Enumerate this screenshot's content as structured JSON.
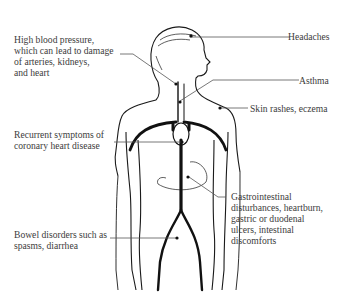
{
  "diagram": {
    "type": "anatomical-annotation",
    "labels": [
      {
        "id": "hbp",
        "text": "High blood pressure,\nwhich can lead to damage\nof arteries, kidneys,\nand heart",
        "side": "left"
      },
      {
        "id": "coronary",
        "text": "Recurrent symptoms of\ncoronary heart disease",
        "side": "left"
      },
      {
        "id": "bowel",
        "text": "Bowel disorders such as\nspasms, diarrhea",
        "side": "left"
      },
      {
        "id": "headaches",
        "text": "Headaches",
        "side": "right"
      },
      {
        "id": "asthma",
        "text": "Asthma",
        "side": "right"
      },
      {
        "id": "skin",
        "text": "Skin rashes, eczema",
        "side": "right"
      },
      {
        "id": "gi",
        "text": "Gastrointestinal\ndisturbances, heartburn,\ngastric or duodenal\nulcers, intestinal\ndiscomforts",
        "side": "right"
      }
    ],
    "colors": {
      "line": "#555555",
      "outline": "#1a1a1a",
      "text": "#3c3c3c"
    }
  }
}
